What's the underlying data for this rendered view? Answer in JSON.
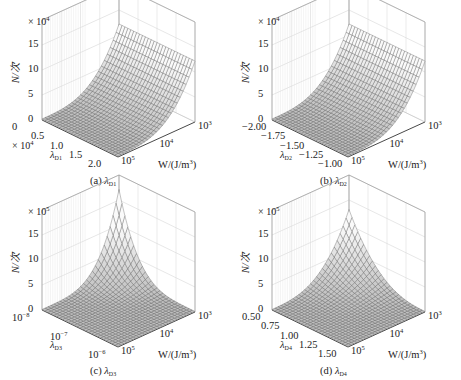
{
  "figure": {
    "panels": [
      {
        "id": "a",
        "caption_prefix": "(a) ",
        "caption_symbol": "λ",
        "caption_sub": "D1",
        "z_label": "N/次",
        "z_multiplier": "× 10",
        "z_multiplier_exp": "4",
        "z_ticks": [
          "0",
          "5",
          "10",
          "15"
        ],
        "lambda_axis_label": "λ",
        "lambda_axis_sub": "D1",
        "lambda_multiplier": "× 10",
        "lambda_multiplier_exp": "4",
        "lambda_ticks": [
          "0",
          "0.5",
          "1.0",
          "1.5",
          "2.0"
        ],
        "w_axis_label": "W/(J/m",
        "w_axis_label_exp": "3",
        "w_axis_label_end": ")",
        "w_ticks": [
          {
            "base": "10",
            "exp": "5"
          },
          {
            "base": "10",
            "exp": "4"
          },
          {
            "base": "10",
            "exp": "3"
          }
        ],
        "surface_shape": "rise-along-lambda-at-low-W"
      },
      {
        "id": "b",
        "caption_prefix": "(b) ",
        "caption_symbol": "λ",
        "caption_sub": "D2",
        "z_label": "N/次",
        "z_multiplier": "× 10",
        "z_multiplier_exp": "4",
        "z_ticks": [
          "0",
          "5",
          "10",
          "15"
        ],
        "lambda_axis_label": "λ",
        "lambda_axis_sub": "D2",
        "lambda_multiplier": "",
        "lambda_multiplier_exp": "",
        "lambda_ticks": [
          "−2.00",
          "−1.75",
          "−1.50",
          "−1.25",
          "−1.00"
        ],
        "w_axis_label": "W/(J/m",
        "w_axis_label_exp": "3",
        "w_axis_label_end": ")",
        "w_ticks": [
          {
            "base": "10",
            "exp": "5"
          },
          {
            "base": "10",
            "exp": "4"
          },
          {
            "base": "10",
            "exp": "3"
          }
        ],
        "surface_shape": "rise-along-lambda-at-low-W"
      },
      {
        "id": "c",
        "caption_prefix": "(c) ",
        "caption_symbol": "λ",
        "caption_sub": "D3",
        "z_label": "N/次",
        "z_multiplier": "× 10",
        "z_multiplier_exp": "5",
        "z_ticks": [
          "0",
          "5",
          "10",
          "15"
        ],
        "lambda_axis_label": "λ",
        "lambda_axis_sub": "D3",
        "lambda_multiplier": "",
        "lambda_multiplier_exp": "",
        "lambda_ticks": [
          {
            "base": "10",
            "exp": "−8"
          },
          {
            "base": "10",
            "exp": "−7"
          },
          {
            "base": "10",
            "exp": "−6"
          }
        ],
        "w_axis_label": "W/(J/m",
        "w_axis_label_exp": "3",
        "w_axis_label_end": ")",
        "w_ticks": [
          {
            "base": "10",
            "exp": "5"
          },
          {
            "base": "10",
            "exp": "4"
          },
          {
            "base": "10",
            "exp": "3"
          }
        ],
        "surface_shape": "peak-at-corner"
      },
      {
        "id": "d",
        "caption_prefix": "(d) ",
        "caption_symbol": "λ",
        "caption_sub": "D4",
        "z_label": "N/次",
        "z_multiplier": "× 10",
        "z_multiplier_exp": "5",
        "z_ticks": [
          "0",
          "5",
          "10",
          "15"
        ],
        "lambda_axis_label": "λ",
        "lambda_axis_sub": "D4",
        "lambda_multiplier": "",
        "lambda_multiplier_exp": "",
        "lambda_ticks": [
          "0.50",
          "0.75",
          "1.00",
          "1.25",
          "1.50"
        ],
        "w_axis_label": "W/(J/m",
        "w_axis_label_exp": "3",
        "w_axis_label_end": ")",
        "w_ticks": [
          {
            "base": "10",
            "exp": "5"
          },
          {
            "base": "10",
            "exp": "4"
          },
          {
            "base": "10",
            "exp": "3"
          }
        ],
        "surface_shape": "peak-at-corner-skewed"
      }
    ]
  },
  "chart_data": [
    {
      "type": "surface",
      "title": "(a) λD1",
      "xlabel": "λD1 (×10^4)",
      "ylabel": "W/(J/m^3)",
      "zlabel": "N/次 (×10^4)",
      "x_ticks": [
        0,
        0.5,
        1.0,
        1.5,
        2.0
      ],
      "y_ticks": [
        "10^5",
        "10^4",
        "10^3"
      ],
      "z_ticks": [
        0,
        5,
        10,
        15
      ],
      "zlim": [
        0,
        15
      ],
      "grid": true,
      "description": "Fatigue life N rises as W decreases toward 10^3; roughly 0 at W=10^5, reaching about 12×10^4 at W=10^3; nearly flat along λD1"
    },
    {
      "type": "surface",
      "title": "(b) λD2",
      "xlabel": "λD2",
      "ylabel": "W/(J/m^3)",
      "zlabel": "N/次 (×10^4)",
      "x_ticks": [
        -2.0,
        -1.75,
        -1.5,
        -1.25,
        -1.0
      ],
      "y_ticks": [
        "10^5",
        "10^4",
        "10^3"
      ],
      "z_ticks": [
        0,
        5,
        10,
        15
      ],
      "zlim": [
        0,
        15
      ],
      "grid": true,
      "description": "Fatigue life N rises as W decreases toward 10^3; about 12×10^4 at W=10^3; nearly flat along λD2"
    },
    {
      "type": "surface",
      "title": "(c) λD3",
      "xlabel": "λD3",
      "ylabel": "W/(J/m^3)",
      "zlabel": "N/次 (×10^5)",
      "x_ticks": [
        "10^-8",
        "10^-7",
        "10^-6"
      ],
      "y_ticks": [
        "10^5",
        "10^4",
        "10^3"
      ],
      "z_ticks": [
        0,
        5,
        10,
        15
      ],
      "zlim": [
        0,
        15
      ],
      "grid": true,
      "description": "Sharp peak of about 17×10^5 at λD3=10^-8, W=10^3; decays rapidly to near 0 elsewhere"
    },
    {
      "type": "surface",
      "title": "(d) λD4",
      "xlabel": "λD4",
      "ylabel": "W/(J/m^3)",
      "zlabel": "N/次 (×10^5)",
      "x_ticks": [
        0.5,
        0.75,
        1.0,
        1.25,
        1.5
      ],
      "y_ticks": [
        "10^5",
        "10^4",
        "10^3"
      ],
      "z_ticks": [
        0,
        5,
        10,
        15
      ],
      "zlim": [
        0,
        15
      ],
      "grid": true,
      "description": "Peak of about 13×10^5 at λD4=0.5, W=10^3; decays toward 0 as λD4 increases or W increases"
    }
  ]
}
